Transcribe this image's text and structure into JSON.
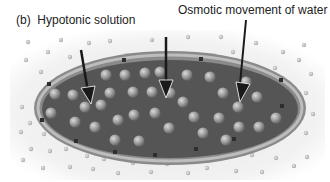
{
  "figure": {
    "panel_label": "(b)",
    "title": "Hypotonic solution",
    "annotation": "Osmotic movement of water",
    "colors": {
      "background": "#ffffff",
      "solution_haze": "#ececec",
      "cytoplasm": "#555555",
      "membrane_outer": "#8a8a8a",
      "membrane_band": "#b5b5b5",
      "solute_inside": "#9a9a9a",
      "solute_outside": "#b9b9b9",
      "arrow": "#1a1a1a"
    },
    "arrows_count": 3
  }
}
